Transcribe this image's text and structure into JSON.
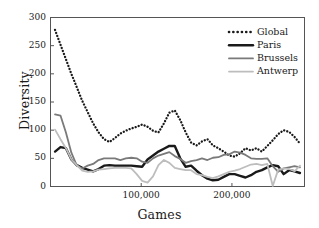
{
  "chart_data": {
    "type": "line",
    "title": "",
    "xlabel": "Games",
    "ylabel": "Diversity",
    "xlim": [
      0,
      280000
    ],
    "ylim": [
      0,
      300
    ],
    "ytick_labels": [
      "0",
      "50",
      "100",
      "150",
      "200",
      "250",
      "300"
    ],
    "ytick_values": [
      0,
      50,
      100,
      150,
      200,
      250,
      300
    ],
    "xtick_labels": [
      "100,000",
      "200,000"
    ],
    "xtick_values": [
      100000,
      200000
    ],
    "grid": false,
    "legend_position": "top-right",
    "legend_entries": [
      "Global",
      "Paris",
      "Brussels",
      "Antwerp"
    ],
    "colors": {
      "global": "#1a1a1a",
      "paris": "#1a1a1a",
      "brussels": "#7a7a7a",
      "antwerp": "#bdbdbd",
      "frame": "#555555",
      "background": "#ffffff"
    },
    "x": [
      5000,
      11000,
      17000,
      23000,
      29000,
      35000,
      41000,
      47000,
      53000,
      59000,
      65000,
      71000,
      77000,
      83000,
      89000,
      95000,
      101000,
      107000,
      113000,
      119000,
      125000,
      131000,
      137000,
      143000,
      149000,
      155000,
      161000,
      167000,
      173000,
      179000,
      185000,
      191000,
      197000,
      203000,
      209000,
      215000,
      221000,
      227000,
      233000,
      239000,
      245000,
      251000,
      257000,
      263000,
      269000,
      275000
    ],
    "series": [
      {
        "name": "Global",
        "style": "dotted",
        "linewidth": 2.2,
        "values": [
          278,
          252,
          226,
          200,
          176,
          152,
          132,
          112,
          96,
          84,
          79,
          86,
          94,
          99,
          103,
          106,
          110,
          106,
          99,
          96,
          112,
          131,
          135,
          118,
          96,
          78,
          73,
          80,
          84,
          73,
          68,
          62,
          55,
          53,
          59,
          68,
          64,
          68,
          62,
          72,
          82,
          93,
          100,
          97,
          88,
          76
        ]
      },
      {
        "name": "Paris",
        "style": "solid",
        "linewidth": 2.4,
        "values": [
          62,
          70,
          68,
          48,
          38,
          33,
          30,
          27,
          31,
          37,
          38,
          37,
          37,
          37,
          37,
          36,
          35,
          48,
          55,
          62,
          67,
          72,
          72,
          50,
          35,
          37,
          28,
          20,
          14,
          11,
          12,
          17,
          22,
          22,
          19,
          16,
          20,
          26,
          29,
          34,
          38,
          36,
          22,
          29,
          27,
          24
        ]
      },
      {
        "name": "Brussels",
        "style": "solid",
        "linewidth": 1.8,
        "values": [
          128,
          126,
          96,
          60,
          37,
          32,
          37,
          40,
          47,
          50,
          50,
          50,
          47,
          50,
          51,
          50,
          44,
          42,
          50,
          55,
          58,
          61,
          54,
          49,
          42,
          45,
          47,
          50,
          47,
          51,
          52,
          56,
          57,
          62,
          60,
          56,
          50,
          49,
          49,
          50,
          36,
          26,
          32,
          34,
          36,
          34
        ]
      },
      {
        "name": "Antwerp",
        "style": "solid",
        "linewidth": 1.8,
        "values": [
          101,
          84,
          68,
          48,
          38,
          28,
          26,
          27,
          30,
          31,
          32,
          33,
          33,
          33,
          32,
          22,
          10,
          7,
          18,
          38,
          47,
          42,
          33,
          31,
          29,
          29,
          22,
          20,
          17,
          15,
          18,
          22,
          26,
          28,
          31,
          35,
          39,
          40,
          38,
          40,
          1,
          30,
          32,
          31,
          27,
          37
        ]
      }
    ]
  }
}
